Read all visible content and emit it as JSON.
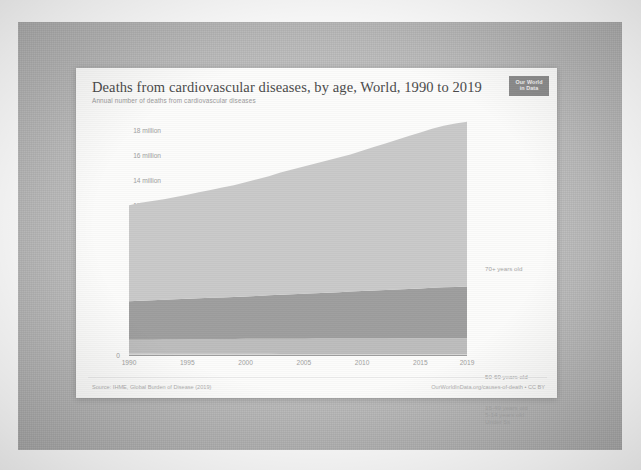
{
  "card": {
    "title": "Deaths from cardiovascular diseases, by age, World, 1990 to 2019",
    "subtitle": "Annual number of deaths from cardiovascular diseases",
    "badge_line1": "Our World",
    "badge_line2": "in Data",
    "source": "Source: IHME, Global Burden of Disease (2019)",
    "credit": "OurWorldInData.org/causes-of-death • CC BY"
  },
  "chart_data": {
    "type": "area",
    "title": "Deaths from cardiovascular diseases, by age, World, 1990 to 2019",
    "subtitle": "Annual number of deaths from cardiovascular diseases",
    "xlabel": "",
    "ylabel": "",
    "stacked": true,
    "grid": false,
    "legend_position": "right",
    "xlim": [
      1990,
      2019
    ],
    "ylim": [
      0,
      19000000
    ],
    "ytick_labels": [
      "0",
      "2 million",
      "4 million",
      "6 million",
      "8 million",
      "10 million",
      "12 million",
      "14 million",
      "16 million",
      "18 million"
    ],
    "ytick_values": [
      0,
      2000000,
      4000000,
      6000000,
      8000000,
      10000000,
      12000000,
      14000000,
      16000000,
      18000000
    ],
    "xtick_labels": [
      "1990",
      "1995",
      "2000",
      "2005",
      "2010",
      "2015",
      "2019"
    ],
    "xtick_values": [
      1990,
      1995,
      2000,
      2005,
      2010,
      2015,
      2019
    ],
    "x": [
      1990,
      1991,
      1992,
      1993,
      1994,
      1995,
      1996,
      1997,
      1998,
      1999,
      2000,
      2001,
      2002,
      2003,
      2004,
      2005,
      2006,
      2007,
      2008,
      2009,
      2010,
      2011,
      2012,
      2013,
      2014,
      2015,
      2016,
      2017,
      2018,
      2019
    ],
    "series": [
      {
        "name": "Under 5s",
        "color": "#cfcfcf",
        "values": [
          60000,
          59000,
          58000,
          57000,
          56000,
          55000,
          54000,
          53000,
          52000,
          51000,
          50000,
          49000,
          48000,
          47000,
          46000,
          45000,
          44000,
          43000,
          42000,
          41000,
          40000,
          39000,
          38000,
          37000,
          36000,
          35000,
          34000,
          33000,
          32000,
          31000
        ]
      },
      {
        "name": "5-14 years old",
        "color": "#c6c6c6",
        "values": [
          55000,
          54000,
          53000,
          52000,
          51000,
          50000,
          49000,
          48000,
          47000,
          46000,
          45000,
          44000,
          43000,
          42000,
          41000,
          40000,
          39000,
          38000,
          37000,
          36000,
          35000,
          34000,
          33000,
          32000,
          31000,
          30000,
          29000,
          28000,
          27000,
          26000
        ]
      },
      {
        "name": "15-49 years old",
        "color": "#bdbdbd",
        "values": [
          1100000,
          1110000,
          1120000,
          1130000,
          1140000,
          1150000,
          1160000,
          1170000,
          1180000,
          1190000,
          1200000,
          1205000,
          1210000,
          1215000,
          1220000,
          1225000,
          1230000,
          1235000,
          1240000,
          1245000,
          1250000,
          1255000,
          1260000,
          1265000,
          1270000,
          1275000,
          1280000,
          1285000,
          1290000,
          1295000
        ]
      },
      {
        "name": "50-69 years old",
        "color": "#9e9e9e",
        "values": [
          3100000,
          3130000,
          3160000,
          3190000,
          3220000,
          3250000,
          3280000,
          3310000,
          3340000,
          3370000,
          3400000,
          3440000,
          3480000,
          3520000,
          3560000,
          3600000,
          3640000,
          3680000,
          3720000,
          3760000,
          3800000,
          3840000,
          3880000,
          3920000,
          3960000,
          4000000,
          4040000,
          4080000,
          4110000,
          4140000
        ]
      },
      {
        "name": "70+ years old",
        "color": "#c9c9c9",
        "values": [
          7700000,
          7850000,
          7950000,
          8050000,
          8200000,
          8350000,
          8500000,
          8650000,
          8800000,
          8950000,
          9150000,
          9350000,
          9550000,
          9800000,
          10000000,
          10200000,
          10400000,
          10600000,
          10800000,
          11000000,
          11250000,
          11500000,
          11750000,
          12000000,
          12250000,
          12500000,
          12750000,
          12950000,
          13100000,
          13200000
        ]
      }
    ],
    "totals_endpoints": {
      "1990": 12015000,
      "2019": 18692000
    },
    "series_labels": [
      {
        "name": "70+ years old",
        "y_px": 197
      },
      {
        "name": "50-69 years old",
        "y_px": 305
      },
      {
        "name": "15-49 years old",
        "y_px": 336
      },
      {
        "name": "5-14 years old",
        "y_px": 343
      },
      {
        "name": "Under 5s",
        "y_px": 350
      }
    ]
  }
}
